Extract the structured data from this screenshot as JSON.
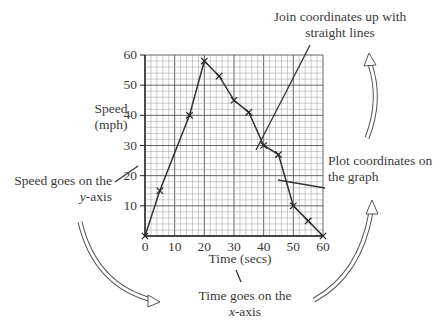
{
  "chart_data": {
    "type": "line",
    "title": "",
    "xlabel": "Time (secs)",
    "ylabel": "Speed (mph)",
    "xlim": [
      0,
      60
    ],
    "ylim": [
      0,
      60
    ],
    "grid": true,
    "x_ticks": [
      0,
      10,
      20,
      30,
      40,
      50,
      60
    ],
    "y_ticks": [
      10,
      20,
      30,
      40,
      50,
      60
    ],
    "x": [
      0,
      5,
      15,
      20,
      25,
      30,
      35,
      40,
      45,
      50,
      55,
      60
    ],
    "series": [
      {
        "name": "Speed",
        "values": [
          0,
          15,
          40,
          58,
          53,
          45,
          41,
          30,
          27,
          10,
          5,
          0
        ],
        "marker": "x"
      }
    ],
    "annotations": [
      "Join coordinates up with straight lines",
      "Plot coordinates on the graph",
      "Speed goes on the y-axis",
      "Time goes on the x-axis"
    ]
  },
  "labels": {
    "ylabel_line1": "Speed",
    "ylabel_line2": "(mph)",
    "xlabel": "Time (secs)",
    "join_line1": "Join coordinates up with",
    "join_line2": "straight lines",
    "plot_line1": "Plot coordinates on",
    "plot_line2": "the graph",
    "speed_line1": "Speed goes on the",
    "speed_line2_var": "y",
    "speed_line2_rest": "-axis",
    "time_line1": "Time goes on the",
    "time_line2_var": "x",
    "time_line2_rest": "-axis"
  },
  "colors": {
    "line": "#333333",
    "grid_major": "#555555",
    "grid_minor": "#9a9a9a",
    "text": "#3a3a3a"
  }
}
